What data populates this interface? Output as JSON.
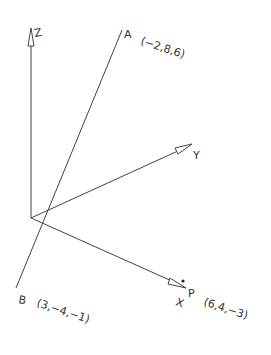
{
  "diagram": {
    "axes": {
      "z_label": "Z",
      "y_label": "Y",
      "x_label": "X"
    },
    "points": {
      "A": {
        "name": "A",
        "coords": "(−2,8,6)"
      },
      "B": {
        "name": "B",
        "coords": "(3,−4,−1)"
      },
      "P": {
        "name": "P",
        "coords": "(6,4,−3)"
      }
    },
    "colors": {
      "line": "#444444",
      "text": "#333333",
      "background": "#ffffff"
    }
  }
}
